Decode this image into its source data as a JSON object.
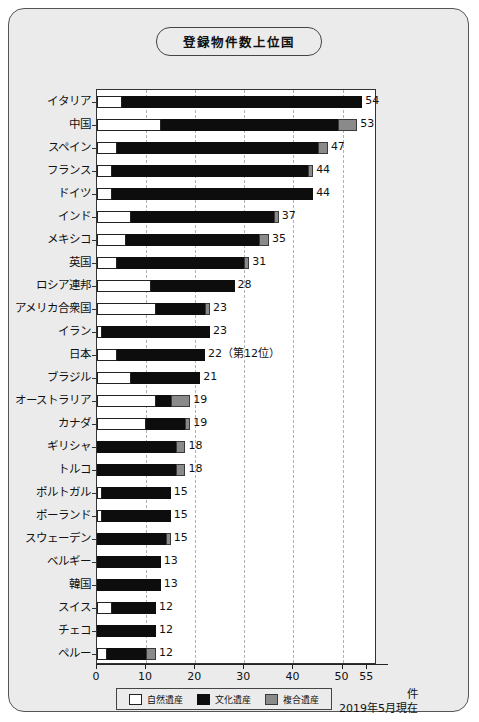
{
  "chart_data": {
    "type": "bar",
    "title": "登録物件数上位国",
    "xlabel": "件",
    "ylabel": "",
    "xlim": [
      0,
      57
    ],
    "grid": true,
    "orientation": "horizontal",
    "stacked": true,
    "legend_position": "bottom",
    "as_of": "2019年5月現在",
    "unit": "件",
    "xticks": [
      0,
      10,
      20,
      30,
      40,
      50,
      55
    ],
    "xticklabels": [
      "0",
      "10",
      "20",
      "30",
      "40",
      "50",
      "55"
    ],
    "series": [
      {
        "name": "自然遺産",
        "key": "natural",
        "color": "#ffffff"
      },
      {
        "name": "文化遺産",
        "key": "cultural",
        "color": "#0d0d0d"
      },
      {
        "name": "複合遺産",
        "key": "mixed",
        "color": "#8a8a8a"
      }
    ],
    "categories": [
      "イタリア",
      "中国",
      "スペイン",
      "フランス",
      "ドイツ",
      "インド",
      "メキシコ",
      "英国",
      "ロシア連邦",
      "アメリカ合衆国",
      "イラン",
      "日本",
      "ブラジル",
      "オーストラリア",
      "カナダ",
      "ギリシャ",
      "トルコ",
      "ポルトガル",
      "ポーランド",
      "スウェーデン",
      "ベルギー",
      "韓国",
      "スイス",
      "チェコ",
      "ペルー"
    ],
    "rows": [
      {
        "category": "イタリア",
        "natural": 5,
        "cultural": 49,
        "mixed": 0,
        "total": 54,
        "label": "54"
      },
      {
        "category": "中国",
        "natural": 13,
        "cultural": 36,
        "mixed": 4,
        "total": 53,
        "label": "53"
      },
      {
        "category": "スペイン",
        "natural": 4,
        "cultural": 41,
        "mixed": 2,
        "total": 47,
        "label": "47"
      },
      {
        "category": "フランス",
        "natural": 3,
        "cultural": 40,
        "mixed": 1,
        "total": 44,
        "label": "44"
      },
      {
        "category": "ドイツ",
        "natural": 3,
        "cultural": 41,
        "mixed": 0,
        "total": 44,
        "label": "44"
      },
      {
        "category": "インド",
        "natural": 7,
        "cultural": 29,
        "mixed": 1,
        "total": 37,
        "label": "37"
      },
      {
        "category": "メキシコ",
        "natural": 6,
        "cultural": 27,
        "mixed": 2,
        "total": 35,
        "label": "35"
      },
      {
        "category": "英国",
        "natural": 4,
        "cultural": 26,
        "mixed": 1,
        "total": 31,
        "label": "31"
      },
      {
        "category": "ロシア連邦",
        "natural": 11,
        "cultural": 17,
        "mixed": 0,
        "total": 28,
        "label": "28"
      },
      {
        "category": "アメリカ合衆国",
        "natural": 12,
        "cultural": 10,
        "mixed": 1,
        "total": 23,
        "label": "23"
      },
      {
        "category": "イラン",
        "natural": 1,
        "cultural": 22,
        "mixed": 0,
        "total": 23,
        "label": "23"
      },
      {
        "category": "日本",
        "natural": 4,
        "cultural": 18,
        "mixed": 0,
        "total": 22,
        "label": "22（第12位）"
      },
      {
        "category": "ブラジル",
        "natural": 7,
        "cultural": 14,
        "mixed": 0,
        "total": 21,
        "label": "21"
      },
      {
        "category": "オーストラリア",
        "natural": 12,
        "cultural": 3,
        "mixed": 4,
        "total": 19,
        "label": "19"
      },
      {
        "category": "カナダ",
        "natural": 10,
        "cultural": 8,
        "mixed": 1,
        "total": 19,
        "label": "19"
      },
      {
        "category": "ギリシャ",
        "natural": 0,
        "cultural": 16,
        "mixed": 2,
        "total": 18,
        "label": "18"
      },
      {
        "category": "トルコ",
        "natural": 0,
        "cultural": 16,
        "mixed": 2,
        "total": 18,
        "label": "18"
      },
      {
        "category": "ポルトガル",
        "natural": 1,
        "cultural": 14,
        "mixed": 0,
        "total": 15,
        "label": "15"
      },
      {
        "category": "ポーランド",
        "natural": 1,
        "cultural": 14,
        "mixed": 0,
        "total": 15,
        "label": "15"
      },
      {
        "category": "スウェーデン",
        "natural": 0,
        "cultural": 14,
        "mixed": 1,
        "total": 15,
        "label": "15"
      },
      {
        "category": "ベルギー",
        "natural": 0,
        "cultural": 13,
        "mixed": 0,
        "total": 13,
        "label": "13"
      },
      {
        "category": "韓国",
        "natural": 0,
        "cultural": 13,
        "mixed": 0,
        "total": 13,
        "label": "13"
      },
      {
        "category": "スイス",
        "natural": 3,
        "cultural": 9,
        "mixed": 0,
        "total": 12,
        "label": "12"
      },
      {
        "category": "チェコ",
        "natural": 0,
        "cultural": 12,
        "mixed": 0,
        "total": 12,
        "label": "12"
      },
      {
        "category": "ペルー",
        "natural": 2,
        "cultural": 8,
        "mixed": 2,
        "total": 12,
        "label": "12"
      }
    ]
  }
}
